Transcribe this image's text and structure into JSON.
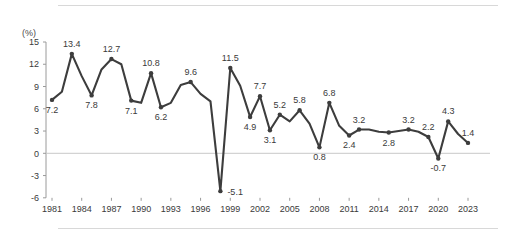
{
  "chart_data": {
    "type": "line",
    "title": "",
    "subtitle": "",
    "xlabel": "",
    "ylabel": "",
    "unit_label": "(%)",
    "ylim": [
      -6,
      15
    ],
    "xlim": [
      1981,
      2023
    ],
    "grid": false,
    "zero_line": true,
    "legend": "none",
    "y_ticks": [
      "15",
      "12",
      "9",
      "6",
      "3",
      "0",
      "-3",
      "-6"
    ],
    "y_tick_values": [
      15,
      12,
      9,
      6,
      3,
      0,
      -3,
      -6
    ],
    "x_ticks": [
      "1981",
      "1984",
      "1987",
      "1990",
      "1993",
      "1996",
      "1999",
      "2002",
      "2005",
      "2008",
      "2011",
      "2014",
      "2017",
      "2020",
      "2023"
    ],
    "x_tick_values": [
      1981,
      1984,
      1987,
      1990,
      1993,
      1996,
      1999,
      2002,
      2005,
      2008,
      2011,
      2014,
      2017,
      2020,
      2023
    ],
    "x": [
      1981,
      1982,
      1983,
      1984,
      1985,
      1986,
      1987,
      1988,
      1989,
      1990,
      1991,
      1992,
      1993,
      1994,
      1995,
      1996,
      1997,
      1998,
      1999,
      2000,
      2001,
      2002,
      2003,
      2004,
      2005,
      2006,
      2007,
      2008,
      2009,
      2010,
      2011,
      2012,
      2013,
      2014,
      2015,
      2016,
      2017,
      2018,
      2019,
      2020,
      2021,
      2022,
      2023
    ],
    "values": [
      7.2,
      8.3,
      13.4,
      10.4,
      7.8,
      11.3,
      12.7,
      12.0,
      7.1,
      6.8,
      10.8,
      6.2,
      6.8,
      9.2,
      9.6,
      8.0,
      7.0,
      -5.1,
      11.5,
      9.1,
      4.9,
      7.7,
      3.1,
      5.2,
      4.3,
      5.8,
      4.0,
      0.8,
      6.8,
      3.7,
      2.4,
      3.2,
      3.2,
      2.9,
      2.8,
      3.0,
      3.2,
      2.9,
      2.2,
      -0.7,
      4.3,
      2.6,
      1.4
    ],
    "point_labels": [
      {
        "year": 1981,
        "value": 7.2,
        "text": "7.2",
        "pos": "below"
      },
      {
        "year": 1983,
        "value": 13.4,
        "text": "13.4",
        "pos": "above"
      },
      {
        "year": 1985,
        "value": 7.8,
        "text": "7.8",
        "pos": "below"
      },
      {
        "year": 1987,
        "value": 12.7,
        "text": "12.7",
        "pos": "above"
      },
      {
        "year": 1989,
        "value": 7.1,
        "text": "7.1",
        "pos": "below"
      },
      {
        "year": 1991,
        "value": 10.8,
        "text": "10.8",
        "pos": "above"
      },
      {
        "year": 1992,
        "value": 6.2,
        "text": "6.2",
        "pos": "below"
      },
      {
        "year": 1995,
        "value": 9.6,
        "text": "9.6",
        "pos": "above"
      },
      {
        "year": 1998,
        "value": -5.1,
        "text": "-5.1",
        "pos": "right"
      },
      {
        "year": 1999,
        "value": 11.5,
        "text": "11.5",
        "pos": "above"
      },
      {
        "year": 2001,
        "value": 4.9,
        "text": "4.9",
        "pos": "below"
      },
      {
        "year": 2002,
        "value": 7.7,
        "text": "7.7",
        "pos": "above"
      },
      {
        "year": 2003,
        "value": 3.1,
        "text": "3.1",
        "pos": "below"
      },
      {
        "year": 2004,
        "value": 5.2,
        "text": "5.2",
        "pos": "above"
      },
      {
        "year": 2006,
        "value": 5.8,
        "text": "5.8",
        "pos": "above"
      },
      {
        "year": 2008,
        "value": 0.8,
        "text": "0.8",
        "pos": "below"
      },
      {
        "year": 2009,
        "value": 6.8,
        "text": "6.8",
        "pos": "above"
      },
      {
        "year": 2011,
        "value": 2.4,
        "text": "2.4",
        "pos": "below"
      },
      {
        "year": 2012,
        "value": 3.2,
        "text": "3.2",
        "pos": "above"
      },
      {
        "year": 2015,
        "value": 2.8,
        "text": "2.8",
        "pos": "below"
      },
      {
        "year": 2017,
        "value": 3.2,
        "text": "3.2",
        "pos": "above"
      },
      {
        "year": 2019,
        "value": 2.2,
        "text": "2.2",
        "pos": "above"
      },
      {
        "year": 2020,
        "value": -0.7,
        "text": "-0.7",
        "pos": "below"
      },
      {
        "year": 2021,
        "value": 4.3,
        "text": "4.3",
        "pos": "above"
      },
      {
        "year": 2023,
        "value": 1.4,
        "text": "1.4",
        "pos": "above"
      }
    ],
    "colors": {
      "line": "#3d3d3d",
      "axis": "#9a9a9a",
      "zero_line": "#c9c9c9",
      "text": "#3a3a3a",
      "rule": "#d8d8d8",
      "background": "#ffffff"
    }
  }
}
